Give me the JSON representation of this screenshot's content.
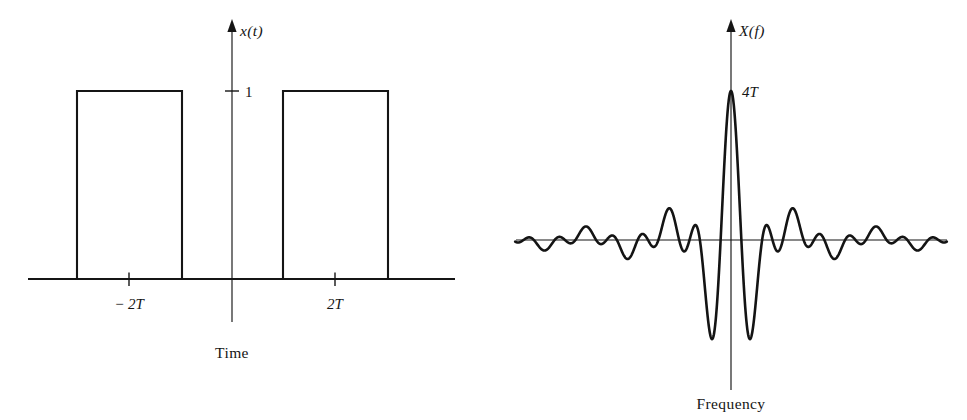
{
  "figure": {
    "background_color": "#ffffff",
    "ink_color": "#151515",
    "panels": [
      {
        "id": "time-domain",
        "axis_label_y": "x(t)",
        "axis_caption": "Time",
        "amplitude_tick_label": "1",
        "x_tick_labels": [
          "− 2T",
          "2T"
        ]
      },
      {
        "id": "frequency-domain",
        "axis_label_y": "X(f)",
        "axis_caption": "Frequency",
        "peak_label": "4T"
      }
    ]
  },
  "chart_data": [
    {
      "type": "line",
      "id": "time-domain",
      "title": "",
      "xlabel": "Time",
      "ylabel": "x(t)",
      "description": "Two unit-amplitude rectangular pulses, one centered at -2T and one centered at +2T, each of width 2T.",
      "ylim": [
        0,
        1.25
      ],
      "xlim": [
        -5.2,
        5.2
      ],
      "yticks": [
        1
      ],
      "ytick_labels": [
        "1"
      ],
      "xticks": [
        -2,
        2
      ],
      "xtick_labels": [
        "− 2T",
        "2T"
      ],
      "grid": false,
      "legend": "none",
      "series": [
        {
          "name": "x(t)",
          "x": [
            -5.2,
            -3.0,
            -3.0,
            -1.0,
            -1.0,
            1.0,
            1.0,
            3.0,
            3.0,
            5.2
          ],
          "values": [
            0,
            0,
            1,
            1,
            0,
            0,
            1,
            1,
            0,
            0
          ]
        }
      ],
      "pulses": [
        {
          "center": -2,
          "half_width": 1,
          "height": 1,
          "units": "T"
        },
        {
          "center": 2,
          "half_width": 1,
          "height": 1,
          "units": "T"
        }
      ]
    },
    {
      "type": "line",
      "id": "frequency-domain",
      "title": "",
      "xlabel": "Frequency",
      "ylabel": "X(f)",
      "description": "Fourier transform of two rectangular pulses: a sinc envelope of width 2T modulated by a cosine from the 4T separation. Peak value 4T at f = 0, two deep negative side lobes adjacent to the main lobe, then decaying ripples.",
      "peak_value_label": "4T",
      "peak_value": 4,
      "peak_at_x": 0,
      "ylim": [
        -2.3,
        4.4
      ],
      "xlim": [
        -2.6,
        2.6
      ],
      "grid": false,
      "legend": "none",
      "formula": "X(f) = 4T * sinc(2*f*T) * cos(4*pi*f*T)",
      "envelope": "4T * sinc(2 f T)",
      "modulation": "cos(4 pi f T)",
      "zero_crossings_per_unit": 2,
      "series": [
        {
          "name": "X(f)",
          "sampled_x": [
            -2.6,
            -2.2,
            -1.8,
            -1.4,
            -1.0,
            -0.75,
            -0.5,
            -0.375,
            -0.25,
            -0.125,
            0,
            0.125,
            0.25,
            0.375,
            0.5,
            0.75,
            1.0,
            1.4,
            1.8,
            2.2,
            2.6
          ],
          "sampled_values": [
            0.1,
            -0.28,
            0.35,
            -0.45,
            0.62,
            -0.9,
            1.1,
            -1.7,
            0.0,
            3.2,
            4.0,
            3.2,
            0.0,
            -1.7,
            1.1,
            -0.9,
            0.62,
            -0.45,
            0.35,
            -0.28,
            0.1
          ]
        }
      ]
    }
  ]
}
